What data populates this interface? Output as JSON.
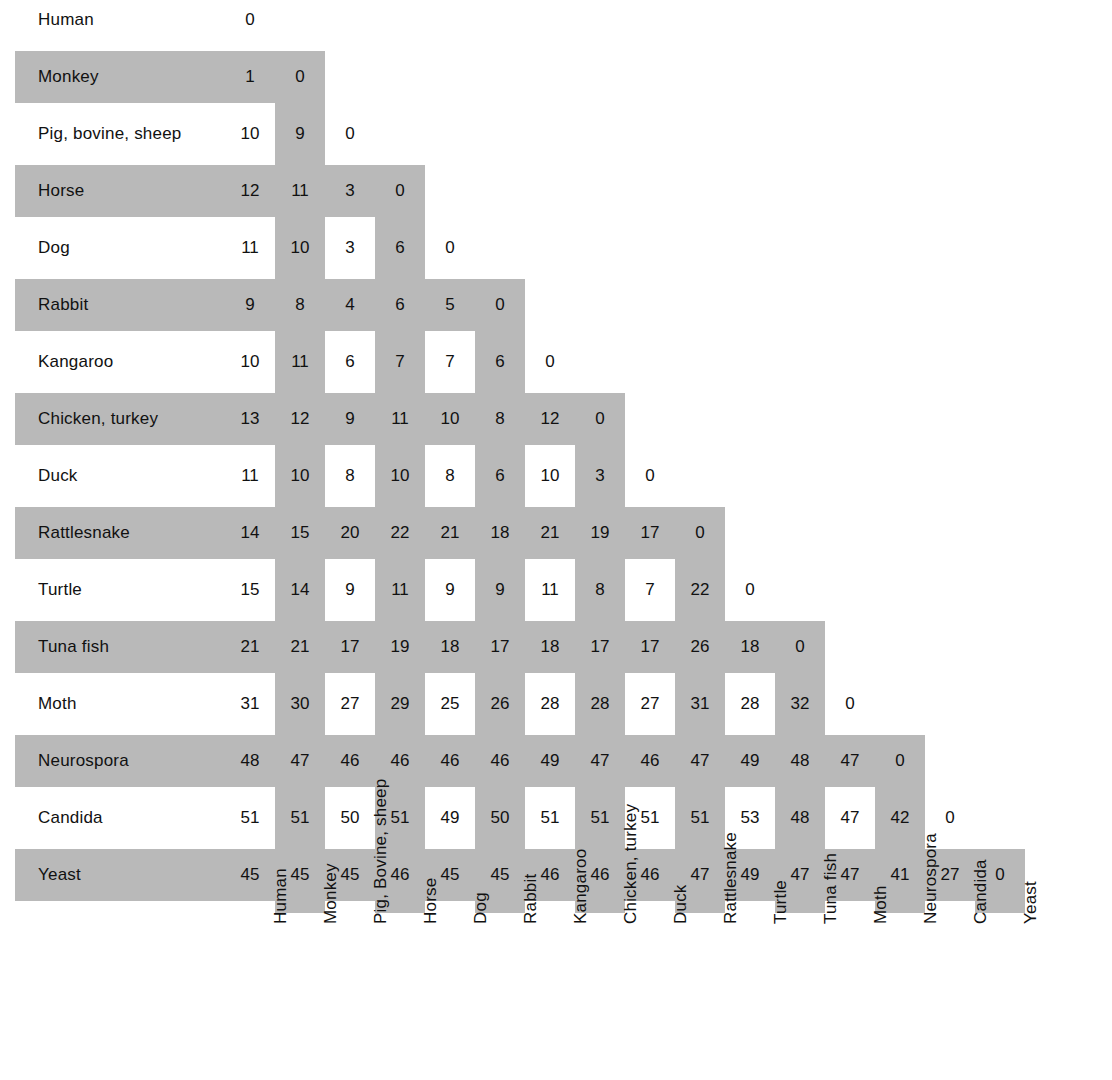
{
  "figure": {
    "caption": "",
    "colors": {
      "band_shade": "#b9b9b9",
      "cross_shade": "#9a9a9a",
      "background": "#ffffff",
      "text": "#111111"
    }
  },
  "chart_data": {
    "type": "heatmap",
    "xlabel": "",
    "ylabel": "",
    "grid": false,
    "legend_position": "none",
    "note": "Lower-triangular symmetric difference matrix; value = number of amino-acid differences between the two species' cytochrome c.",
    "row_labels": [
      "Human",
      "Monkey",
      "Pig, bovine, sheep",
      "Horse",
      "Dog",
      "Rabbit",
      "Kangaroo",
      "Chicken, turkey",
      "Duck",
      "Rattlesnake",
      "Turtle",
      "Tuna  fish",
      "Moth",
      "Neurospora",
      "Candida",
      "Yeast"
    ],
    "column_labels": [
      "Human",
      "Monkey",
      "Pig, Bovine, sheep",
      "Horse",
      "Dog",
      "Rabbit",
      "Kangaroo",
      "Chicken, turkey",
      "Duck",
      "Rattlesnake",
      "Turtle",
      "Tuna fish",
      "Moth",
      "Neurospora",
      "Candida",
      "Yeast"
    ],
    "values": [
      [
        0
      ],
      [
        1,
        0
      ],
      [
        10,
        9,
        0
      ],
      [
        12,
        11,
        3,
        0
      ],
      [
        11,
        10,
        3,
        6,
        0
      ],
      [
        9,
        8,
        4,
        6,
        5,
        0
      ],
      [
        10,
        11,
        6,
        7,
        7,
        6,
        0
      ],
      [
        13,
        12,
        9,
        11,
        10,
        8,
        12,
        0
      ],
      [
        11,
        10,
        8,
        10,
        8,
        6,
        10,
        3,
        0
      ],
      [
        14,
        15,
        20,
        22,
        21,
        18,
        21,
        19,
        17,
        0
      ],
      [
        15,
        14,
        9,
        11,
        9,
        9,
        11,
        8,
        7,
        22,
        0
      ],
      [
        21,
        21,
        17,
        19,
        18,
        17,
        18,
        17,
        17,
        26,
        18,
        0
      ],
      [
        31,
        30,
        27,
        29,
        25,
        26,
        28,
        28,
        27,
        31,
        28,
        32,
        0
      ],
      [
        48,
        47,
        46,
        46,
        46,
        46,
        49,
        47,
        46,
        47,
        49,
        48,
        47,
        0
      ],
      [
        51,
        51,
        50,
        51,
        49,
        50,
        51,
        51,
        51,
        51,
        53,
        48,
        47,
        42,
        0
      ],
      [
        45,
        45,
        45,
        46,
        45,
        45,
        46,
        46,
        46,
        47,
        49,
        47,
        47,
        41,
        27,
        0
      ]
    ]
  }
}
